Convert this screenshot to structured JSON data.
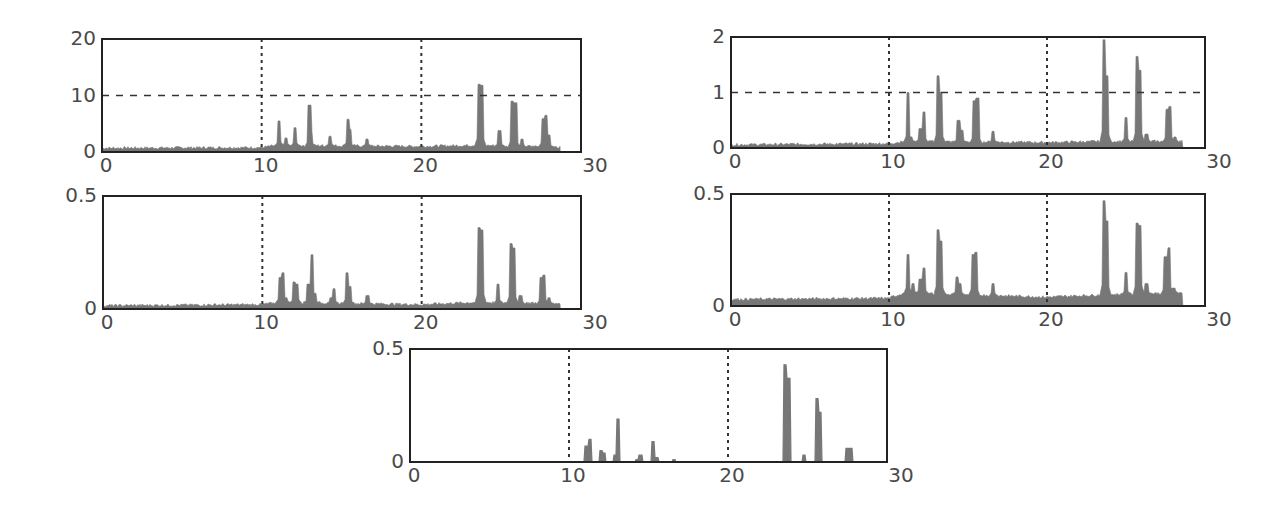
{
  "colors": {
    "bar": "#777777",
    "axis": "#222222",
    "grid": "#333333",
    "tick": "#4a4a4a",
    "background": "#ffffff"
  },
  "chart_data": [
    {
      "type": "area",
      "panel": "top-left",
      "title": "",
      "xlabel": "",
      "ylabel": "",
      "xlim": [
        0,
        30
      ],
      "ylim": [
        0,
        20
      ],
      "xticks": [
        "0",
        "10",
        "20",
        "30"
      ],
      "yticks": [
        "0",
        "10",
        "20"
      ],
      "grid": {
        "x_dotted": [
          10,
          20
        ],
        "y_dashed": [
          10
        ]
      },
      "baseline": [
        [
          0,
          0.7
        ],
        [
          10,
          0.8
        ],
        [
          11,
          1.2
        ],
        [
          20,
          1.0
        ],
        [
          23.5,
          1.2
        ],
        [
          28.5,
          0.9
        ]
      ],
      "peaks": [
        [
          11.1,
          5.5
        ],
        [
          11.5,
          2.5
        ],
        [
          12.1,
          4.3
        ],
        [
          13.0,
          8.3
        ],
        [
          13.1,
          3.5
        ],
        [
          14.3,
          2.8
        ],
        [
          15.4,
          5.8
        ],
        [
          15.5,
          4.0
        ],
        [
          16.6,
          2.3
        ],
        [
          23.6,
          12.0
        ],
        [
          23.8,
          11.8
        ],
        [
          24.9,
          3.8
        ],
        [
          25.7,
          9.0
        ],
        [
          25.9,
          8.7
        ],
        [
          26.3,
          2.3
        ],
        [
          27.6,
          5.9
        ],
        [
          27.8,
          6.5
        ],
        [
          28.0,
          3.0
        ]
      ],
      "end_x": 28.7
    },
    {
      "type": "area",
      "panel": "top-right",
      "xlim": [
        0,
        30
      ],
      "ylim": [
        0,
        2
      ],
      "xticks": [
        "0",
        "10",
        "20",
        "30"
      ],
      "yticks": [
        "0",
        "1",
        "2"
      ],
      "grid": {
        "x_dotted": [
          10,
          20
        ],
        "y_dashed": [
          1
        ]
      },
      "baseline": [
        [
          0,
          0.06
        ],
        [
          10,
          0.08
        ],
        [
          11,
          0.12
        ],
        [
          20,
          0.1
        ],
        [
          23.5,
          0.12
        ],
        [
          28.5,
          0.12
        ]
      ],
      "peaks": [
        [
          11.2,
          1.0
        ],
        [
          11.4,
          0.2
        ],
        [
          12.0,
          0.35
        ],
        [
          12.2,
          0.65
        ],
        [
          13.1,
          1.3
        ],
        [
          13.3,
          1.0
        ],
        [
          14.4,
          0.5
        ],
        [
          14.6,
          0.32
        ],
        [
          15.4,
          0.85
        ],
        [
          15.6,
          0.9
        ],
        [
          16.6,
          0.3
        ],
        [
          23.6,
          1.95
        ],
        [
          23.8,
          1.3
        ],
        [
          25.0,
          0.55
        ],
        [
          25.7,
          1.65
        ],
        [
          25.9,
          1.4
        ],
        [
          26.3,
          0.25
        ],
        [
          27.6,
          0.7
        ],
        [
          27.8,
          0.75
        ],
        [
          28.1,
          0.2
        ]
      ],
      "end_x": 28.6
    },
    {
      "type": "area",
      "panel": "middle-left",
      "xlim": [
        0,
        30
      ],
      "ylim": [
        0,
        0.5
      ],
      "xticks": [
        "0",
        "10",
        "20",
        "30"
      ],
      "yticks": [
        "0",
        "0.5"
      ],
      "grid": {
        "x_dotted": [
          10,
          20
        ],
        "y_dashed": []
      },
      "baseline": [
        [
          0,
          0.015
        ],
        [
          10,
          0.02
        ],
        [
          11,
          0.03
        ],
        [
          20,
          0.02
        ],
        [
          23.5,
          0.03
        ],
        [
          28.5,
          0.025
        ]
      ],
      "peaks": [
        [
          11.1,
          0.14
        ],
        [
          11.3,
          0.16
        ],
        [
          11.5,
          0.05
        ],
        [
          12.0,
          0.12
        ],
        [
          12.2,
          0.11
        ],
        [
          12.9,
          0.11
        ],
        [
          13.1,
          0.24
        ],
        [
          13.3,
          0.07
        ],
        [
          14.3,
          0.05
        ],
        [
          14.5,
          0.09
        ],
        [
          15.3,
          0.16
        ],
        [
          15.5,
          0.1
        ],
        [
          16.6,
          0.06
        ],
        [
          23.6,
          0.36
        ],
        [
          23.8,
          0.35
        ],
        [
          24.8,
          0.11
        ],
        [
          25.6,
          0.29
        ],
        [
          25.8,
          0.27
        ],
        [
          26.2,
          0.06
        ],
        [
          27.5,
          0.14
        ],
        [
          27.7,
          0.15
        ],
        [
          28.0,
          0.05
        ]
      ],
      "end_x": 28.7
    },
    {
      "type": "area",
      "panel": "middle-right",
      "xlim": [
        0,
        30
      ],
      "ylim": [
        0,
        0.5
      ],
      "xticks": [
        "0",
        "10",
        "20",
        "30"
      ],
      "yticks": [
        "0",
        "0.5"
      ],
      "grid": {
        "x_dotted": [
          10,
          20
        ],
        "y_dashed": []
      },
      "baseline": [
        [
          0,
          0.03
        ],
        [
          10,
          0.035
        ],
        [
          11,
          0.06
        ],
        [
          20,
          0.04
        ],
        [
          23.5,
          0.05
        ],
        [
          28.5,
          0.06
        ]
      ],
      "peaks": [
        [
          11.2,
          0.23
        ],
        [
          11.5,
          0.1
        ],
        [
          12.0,
          0.12
        ],
        [
          12.2,
          0.17
        ],
        [
          13.1,
          0.34
        ],
        [
          13.3,
          0.29
        ],
        [
          14.3,
          0.13
        ],
        [
          14.5,
          0.1
        ],
        [
          15.3,
          0.23
        ],
        [
          15.5,
          0.24
        ],
        [
          16.6,
          0.1
        ],
        [
          23.6,
          0.47
        ],
        [
          23.8,
          0.38
        ],
        [
          25.0,
          0.15
        ],
        [
          25.7,
          0.37
        ],
        [
          25.9,
          0.36
        ],
        [
          26.3,
          0.1
        ],
        [
          27.5,
          0.22
        ],
        [
          27.7,
          0.26
        ],
        [
          28.0,
          0.08
        ]
      ],
      "end_x": 28.6
    },
    {
      "type": "bar",
      "panel": "bottom-center",
      "xlim": [
        0,
        30
      ],
      "ylim": [
        0,
        0.5
      ],
      "xticks": [
        "0",
        "10",
        "20",
        "30"
      ],
      "yticks": [
        "0",
        "0.5"
      ],
      "grid": {
        "x_dotted": [
          10,
          20
        ],
        "y_dashed": []
      },
      "baseline": [
        [
          0,
          0.0
        ],
        [
          28.5,
          0.0
        ]
      ],
      "peaks": [
        [
          11.1,
          0.07
        ],
        [
          11.3,
          0.1
        ],
        [
          12.0,
          0.05
        ],
        [
          12.2,
          0.04
        ],
        [
          12.9,
          0.03
        ],
        [
          13.1,
          0.19
        ],
        [
          14.3,
          0.01
        ],
        [
          14.5,
          0.03
        ],
        [
          15.3,
          0.09
        ],
        [
          15.5,
          0.02
        ],
        [
          16.6,
          0.01
        ],
        [
          23.6,
          0.43
        ],
        [
          23.8,
          0.37
        ],
        [
          24.8,
          0.03
        ],
        [
          25.6,
          0.28
        ],
        [
          25.8,
          0.22
        ],
        [
          27.5,
          0.06
        ],
        [
          27.7,
          0.06
        ]
      ],
      "end_x": 28.5
    }
  ],
  "panels_layout": [
    {
      "left": 102,
      "top": 39,
      "width": 479,
      "height": 113,
      "tick_font": 20
    },
    {
      "left": 731,
      "top": 37,
      "width": 474,
      "height": 111,
      "tick_font": 20
    },
    {
      "left": 103,
      "top": 196,
      "width": 478,
      "height": 113,
      "tick_font": 20
    },
    {
      "left": 731,
      "top": 194,
      "width": 474,
      "height": 112,
      "tick_font": 20
    },
    {
      "left": 410,
      "top": 349,
      "width": 477,
      "height": 113,
      "tick_font": 20
    }
  ]
}
